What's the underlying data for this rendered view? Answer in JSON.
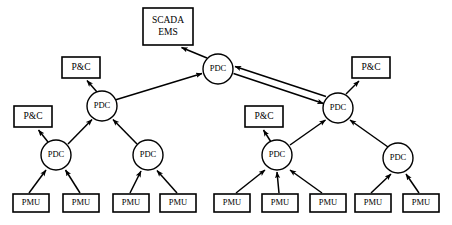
{
  "diagram": {
    "type": "network-tree",
    "canvas": {
      "width": 452,
      "height": 225
    },
    "colors": {
      "background": "#ffffff",
      "stroke": "#000000",
      "fill": "#ffffff"
    },
    "labels": {
      "scada": "SCADA\nEMS",
      "scada_line1": "SCADA",
      "scada_line2": "EMS",
      "pdc": "PDC",
      "pnc": "P&C",
      "pmu": "PMU"
    },
    "nodes": [
      {
        "id": "scada",
        "kind": "box",
        "label_line1": "SCADA",
        "label_line2": "EMS",
        "x": 143,
        "y": 8,
        "w": 50,
        "h": 37
      },
      {
        "id": "pdc-top",
        "kind": "circle",
        "label": "PDC",
        "cx": 218,
        "cy": 69,
        "r": 15
      },
      {
        "id": "pnc-l-top",
        "kind": "box",
        "label": "P&C",
        "x": 62,
        "y": 57,
        "w": 38,
        "h": 21
      },
      {
        "id": "pdc-l1",
        "kind": "circle",
        "label": "PDC",
        "cx": 102,
        "cy": 106,
        "r": 15
      },
      {
        "id": "pnc-l-low",
        "kind": "box",
        "label": "P&C",
        "x": 14,
        "y": 106,
        "w": 38,
        "h": 21
      },
      {
        "id": "pdc-l2a",
        "kind": "circle",
        "label": "PDC",
        "cx": 56,
        "cy": 155,
        "r": 15
      },
      {
        "id": "pdc-l2b",
        "kind": "circle",
        "label": "PDC",
        "cx": 148,
        "cy": 155,
        "r": 15
      },
      {
        "id": "pnc-r-mid",
        "kind": "box",
        "label": "P&C",
        "x": 245,
        "y": 106,
        "w": 38,
        "h": 21
      },
      {
        "id": "pdc-r1",
        "kind": "circle",
        "label": "PDC",
        "cx": 338,
        "cy": 108,
        "r": 15
      },
      {
        "id": "pnc-r-top",
        "kind": "box",
        "label": "P&C",
        "x": 352,
        "y": 57,
        "w": 38,
        "h": 21
      },
      {
        "id": "pdc-r2a",
        "kind": "circle",
        "label": "PDC",
        "cx": 277,
        "cy": 155,
        "r": 15
      },
      {
        "id": "pdc-r2b",
        "kind": "circle",
        "label": "PDC",
        "cx": 398,
        "cy": 158,
        "r": 15
      },
      {
        "id": "pmu-1",
        "kind": "box",
        "label": "PMU",
        "x": 13,
        "y": 194,
        "w": 36,
        "h": 18
      },
      {
        "id": "pmu-2",
        "kind": "box",
        "label": "PMU",
        "x": 63,
        "y": 194,
        "w": 36,
        "h": 18
      },
      {
        "id": "pmu-3",
        "kind": "box",
        "label": "PMU",
        "x": 113,
        "y": 194,
        "w": 36,
        "h": 18
      },
      {
        "id": "pmu-4",
        "kind": "box",
        "label": "PMU",
        "x": 160,
        "y": 194,
        "w": 36,
        "h": 18
      },
      {
        "id": "pmu-5",
        "kind": "box",
        "label": "PMU",
        "x": 214,
        "y": 194,
        "w": 36,
        "h": 18
      },
      {
        "id": "pmu-6",
        "kind": "box",
        "label": "PMU",
        "x": 262,
        "y": 194,
        "w": 36,
        "h": 18
      },
      {
        "id": "pmu-7",
        "kind": "box",
        "label": "PMU",
        "x": 310,
        "y": 194,
        "w": 36,
        "h": 18
      },
      {
        "id": "pmu-8",
        "kind": "box",
        "label": "PMU",
        "x": 355,
        "y": 194,
        "w": 36,
        "h": 18
      },
      {
        "id": "pmu-9",
        "kind": "box",
        "label": "PMU",
        "x": 403,
        "y": 194,
        "w": 36,
        "h": 18
      }
    ],
    "links": [
      {
        "id": "l-pdctop-scada",
        "from": "pdc-top",
        "to": "scada",
        "arrow": "single",
        "x1": 207,
        "y1": 58,
        "x2": 180,
        "y2": 47
      },
      {
        "id": "l-pdcl1-pdctop",
        "from": "pdc-l1",
        "to": "pdc-top",
        "arrow": "single",
        "x1": 115,
        "y1": 100,
        "x2": 203,
        "y2": 73
      },
      {
        "id": "l-pdctop-pdcr1",
        "from": "pdc-top",
        "to": "pdc-r1",
        "arrow": "double",
        "x1": 233,
        "y1": 72,
        "x2": 324,
        "y2": 102
      },
      {
        "id": "l-pdcl1-pnc",
        "from": "pdc-l1",
        "to": "pnc-l-top",
        "arrow": "single",
        "x1": 96,
        "y1": 92,
        "x2": 86,
        "y2": 80
      },
      {
        "id": "l-pdcl2a-pdcl1",
        "from": "pdc-l2a",
        "to": "pdc-l1",
        "arrow": "single",
        "x1": 68,
        "y1": 144,
        "x2": 91,
        "y2": 118
      },
      {
        "id": "l-pdcl2b-pdcl1",
        "from": "pdc-l2b",
        "to": "pdc-l1",
        "arrow": "single",
        "x1": 137,
        "y1": 144,
        "x2": 114,
        "y2": 118
      },
      {
        "id": "l-pdcl2a-pnc",
        "from": "pdc-l2a",
        "to": "pnc-l-low",
        "arrow": "single",
        "x1": 48,
        "y1": 141,
        "x2": 38,
        "y2": 129
      },
      {
        "id": "l-pmu1-pdcl2a",
        "from": "pmu-1",
        "to": "pdc-l2a",
        "arrow": "single",
        "x1": 29,
        "y1": 193,
        "x2": 47,
        "y2": 169
      },
      {
        "id": "l-pmu2-pdcl2a",
        "from": "pmu-2",
        "to": "pdc-l2a",
        "arrow": "single",
        "x1": 79,
        "y1": 193,
        "x2": 65,
        "y2": 169
      },
      {
        "id": "l-pmu3-pdcl2b",
        "from": "pmu-3",
        "to": "pdc-l2b",
        "arrow": "single",
        "x1": 129,
        "y1": 193,
        "x2": 141,
        "y2": 170
      },
      {
        "id": "l-pmu4-pdcl2b",
        "from": "pmu-4",
        "to": "pdc-l2b",
        "arrow": "single",
        "x1": 177,
        "y1": 193,
        "x2": 157,
        "y2": 170
      },
      {
        "id": "l-pdcr1-pnc",
        "from": "pdc-r1",
        "to": "pnc-r-top",
        "arrow": "single",
        "x1": 345,
        "y1": 94,
        "x2": 358,
        "y2": 80
      },
      {
        "id": "l-pdcr2a-pdcr1",
        "from": "pdc-r2a",
        "to": "pdc-r1",
        "arrow": "single",
        "x1": 290,
        "y1": 145,
        "x2": 326,
        "y2": 119
      },
      {
        "id": "l-pdcr2b-pdcr1",
        "from": "pdc-r2b",
        "to": "pdc-r1",
        "arrow": "single",
        "x1": 389,
        "y1": 146,
        "x2": 350,
        "y2": 119
      },
      {
        "id": "l-pdcr2a-pnc",
        "from": "pdc-r2a",
        "to": "pnc-r-mid",
        "arrow": "single",
        "x1": 271,
        "y1": 141,
        "x2": 263,
        "y2": 129
      },
      {
        "id": "l-pmu5-pdcr2a",
        "from": "pmu-5",
        "to": "pdc-r2a",
        "arrow": "single",
        "x1": 236,
        "y1": 193,
        "x2": 266,
        "y2": 169
      },
      {
        "id": "l-pmu6-pdcr2a",
        "from": "pmu-6",
        "to": "pdc-r2a",
        "arrow": "single",
        "x1": 278,
        "y1": 193,
        "x2": 277,
        "y2": 171
      },
      {
        "id": "l-pmu7-pdcr2a",
        "from": "pmu-7",
        "to": "pdc-r2a",
        "arrow": "single",
        "x1": 322,
        "y1": 193,
        "x2": 289,
        "y2": 169
      },
      {
        "id": "l-pmu8-pdcr2b",
        "from": "pmu-8",
        "to": "pdc-r2b",
        "arrow": "single",
        "x1": 371,
        "y1": 193,
        "x2": 391,
        "y2": 173
      },
      {
        "id": "l-pmu9-pdcr2b",
        "from": "pmu-9",
        "to": "pdc-r2b",
        "arrow": "single",
        "x1": 419,
        "y1": 193,
        "x2": 406,
        "y2": 173
      }
    ]
  }
}
